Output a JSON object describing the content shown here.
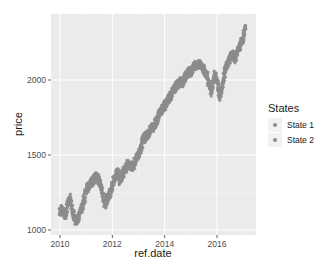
{
  "chart_data": {
    "type": "scatter",
    "title": "",
    "xlabel": "ref.date",
    "ylabel": "price",
    "xlim": [
      2009.7,
      2017.5
    ],
    "ylim": [
      970,
      2440
    ],
    "x_ticks": [
      2010,
      2012,
      2014,
      2016
    ],
    "x_tick_labels": [
      "2010",
      "2012",
      "2014",
      "2016"
    ],
    "y_ticks": [
      1000,
      1500,
      2000
    ],
    "y_tick_labels": [
      "1000",
      "1500",
      "2000"
    ],
    "grid": true,
    "legend": {
      "title": "States",
      "position": "right",
      "entries": [
        {
          "label": "State 1",
          "color": "#8c8c8c"
        },
        {
          "label": "State 2",
          "color": "#8c8c8c"
        }
      ]
    },
    "series": [
      {
        "name": "price",
        "color": "#8c8c8c",
        "x": [
          2010.0,
          2010.1,
          2010.2,
          2010.3,
          2010.4,
          2010.5,
          2010.6,
          2010.7,
          2010.8,
          2010.9,
          2011.0,
          2011.1,
          2011.2,
          2011.3,
          2011.4,
          2011.5,
          2011.6,
          2011.7,
          2011.8,
          2011.9,
          2012.0,
          2012.1,
          2012.2,
          2012.3,
          2012.4,
          2012.5,
          2012.6,
          2012.7,
          2012.8,
          2012.9,
          2013.0,
          2013.1,
          2013.2,
          2013.3,
          2013.4,
          2013.5,
          2013.6,
          2013.7,
          2013.8,
          2013.9,
          2014.0,
          2014.1,
          2014.2,
          2014.3,
          2014.4,
          2014.5,
          2014.6,
          2014.7,
          2014.8,
          2014.9,
          2015.0,
          2015.1,
          2015.2,
          2015.3,
          2015.4,
          2015.5,
          2015.6,
          2015.7,
          2015.8,
          2015.9,
          2016.0,
          2016.1,
          2016.2,
          2016.3,
          2016.4,
          2016.5,
          2016.6,
          2016.7,
          2016.8,
          2016.9,
          2017.0,
          2017.1
        ],
        "values": [
          1120,
          1140,
          1090,
          1170,
          1210,
          1110,
          1060,
          1080,
          1130,
          1180,
          1270,
          1300,
          1320,
          1340,
          1360,
          1330,
          1270,
          1170,
          1210,
          1240,
          1300,
          1360,
          1390,
          1330,
          1380,
          1410,
          1440,
          1420,
          1430,
          1480,
          1500,
          1560,
          1610,
          1630,
          1650,
          1680,
          1690,
          1740,
          1780,
          1800,
          1830,
          1860,
          1880,
          1920,
          1950,
          1970,
          1990,
          1980,
          2020,
          2060,
          2040,
          2090,
          2100,
          2110,
          2090,
          2060,
          2040,
          1970,
          1920,
          2050,
          1990,
          1890,
          1960,
          2060,
          2100,
          2150,
          2170,
          2140,
          2200,
          2240,
          2280,
          2370
        ]
      }
    ]
  }
}
